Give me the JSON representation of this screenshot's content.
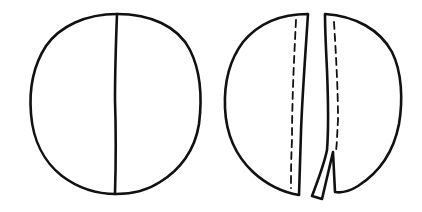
{
  "figure": {
    "background": "#ffffff",
    "stroke_color": "#111111",
    "panels": [
      {
        "name": "whole-circle",
        "description": "Circle with a single vertical dividing line"
      },
      {
        "name": "split-circle",
        "description": "Circle split into two pieces along a cut, each with a dashed fold line",
        "pieces": [
          "left-piece",
          "right-piece"
        ]
      }
    ]
  }
}
